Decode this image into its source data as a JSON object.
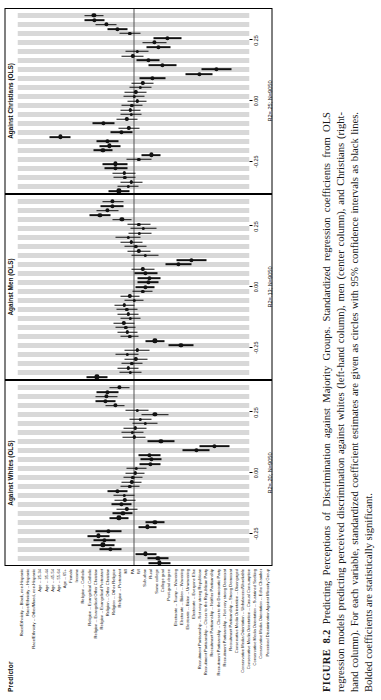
{
  "caption": {
    "figure_number": "FIGURE 8.2",
    "title": "Predicting Perceptions of Discrimination against Majority Groups.",
    "body": "Standardized regression coefficients from OLS regression models predicting perceived discrimination against whites (left-hand column), men (center column), and Christians (right-hand column). For each variable, standardized coefficient estimates are given as circles with 95% confidence intervals as black lines. Bolded coefficients are statistically significant."
  },
  "predictor_header": "Predictor",
  "chart_data": {
    "type": "scatter",
    "title": "Predicting Perceptions of Discrimination against Majority Groups",
    "xlabel": "Standardized coefficient",
    "ylabel": "Predictor",
    "xlim": [
      -0.38,
      0.38
    ],
    "xticks": [
      -0.25,
      0.0,
      0.25
    ],
    "xticklabels": [
      "-0.25",
      "0.00",
      "0.25"
    ],
    "grid": "alternating vertical gray bands per predictor",
    "legend": "none",
    "categories": [
      "Race/Ethnicity -- Black, non-Hispanic",
      "Race/Ethnicity -- Hispanic",
      "Race/Ethnicity -- Other/Mixed, non-Hispanic",
      "Age -- 25-34",
      "Age -- 35-44",
      "Age -- 45-54",
      "Age -- 55-64",
      "Age -- 65+",
      "Female",
      "Income",
      "Religion -- Catholic",
      "Religion -- Evangelical Catholic",
      "Religion -- Evangelical Other Christian",
      "Religion -- Evangelical Protestant",
      "Religion -- Other Christian",
      "Religion -- Other Religion",
      "Religion -- Protestant",
      "MI",
      "PA",
      "WI",
      "Suburban",
      "Rural",
      "Some college",
      "College grad",
      "Post-grad degree",
      "Electorate -- Trump -- Wavering",
      "Electorate -- Biden -- Wavering",
      "Electorate -- Biden -- Unwavering",
      "Electorate -- Everyone Else",
      "Recruitment Partisanship -- Not very strong Republican",
      "Recruitment Partisanship -- Closer to the Republican Party",
      "Recruitment Partisanship -- Neither Partisanship",
      "Recruitment Partisanship -- Closer to the Democratic Party",
      "Recruitment Partisanship -- Not very strong Democrat",
      "Recruitment Partisanship -- Strong Democrat",
      "Conservative Media Orientation -- Disengaged",
      "Conservative Media Orientation -- Unbalanced/Unreliable",
      "Conservative Media Orientation -- Casual Consumption",
      "Conservative Media Orientation -- Sustained Seeking",
      "Conservative Media Orientation -- Echo Chamber",
      "Perceived Discrimination Against Minority Group"
    ],
    "panels": [
      {
        "name": "whites",
        "title": "Against Whites (OLS)",
        "r2_label": "R2=.20; N=9050",
        "r2": 0.2,
        "n": 9050,
        "estimates": [
          {
            "est": -0.085,
            "lo": -0.12,
            "hi": -0.05,
            "sig": true
          },
          {
            "est": -0.08,
            "lo": -0.115,
            "hi": -0.045,
            "sig": true
          },
          {
            "est": -0.04,
            "lo": -0.075,
            "hi": -0.005,
            "sig": true
          },
          {
            "est": 0.075,
            "lo": 0.04,
            "hi": 0.11,
            "sig": true
          },
          {
            "est": 0.1,
            "lo": 0.062,
            "hi": 0.138,
            "sig": true
          },
          {
            "est": 0.095,
            "lo": 0.058,
            "hi": 0.132,
            "sig": true
          },
          {
            "est": 0.115,
            "lo": 0.078,
            "hi": 0.152,
            "sig": true
          },
          {
            "est": 0.082,
            "lo": 0.04,
            "hi": 0.124,
            "sig": true
          },
          {
            "est": -0.045,
            "lo": -0.075,
            "hi": -0.015,
            "sig": true
          },
          {
            "est": -0.07,
            "lo": -0.102,
            "hi": -0.038,
            "sig": true
          },
          {
            "est": 0.048,
            "lo": 0.018,
            "hi": 0.078,
            "sig": true
          },
          {
            "est": 0.035,
            "lo": 0.002,
            "hi": 0.068,
            "sig": true
          },
          {
            "est": 0.022,
            "lo": -0.012,
            "hi": 0.056,
            "sig": false
          },
          {
            "est": 0.04,
            "lo": 0.008,
            "hi": 0.072,
            "sig": true
          },
          {
            "est": 0.028,
            "lo": -0.006,
            "hi": 0.062,
            "sig": false
          },
          {
            "est": 0.03,
            "lo": -0.004,
            "hi": 0.064,
            "sig": false
          },
          {
            "est": 0.052,
            "lo": 0.02,
            "hi": 0.084,
            "sig": true
          },
          {
            "est": 0.012,
            "lo": -0.02,
            "hi": 0.044,
            "sig": false
          },
          {
            "est": 0.006,
            "lo": -0.026,
            "hi": 0.038,
            "sig": false
          },
          {
            "est": 0.002,
            "lo": -0.03,
            "hi": 0.034,
            "sig": false
          },
          {
            "est": -0.005,
            "lo": -0.035,
            "hi": 0.025,
            "sig": false
          },
          {
            "est": -0.01,
            "lo": -0.042,
            "hi": 0.022,
            "sig": false
          },
          {
            "est": -0.055,
            "lo": -0.09,
            "hi": -0.02,
            "sig": true
          },
          {
            "est": -0.058,
            "lo": -0.092,
            "hi": -0.024,
            "sig": true
          },
          {
            "est": -0.052,
            "lo": -0.088,
            "hi": -0.016,
            "sig": true
          },
          {
            "est": -0.205,
            "lo": -0.25,
            "hi": -0.16,
            "sig": true
          },
          {
            "est": -0.265,
            "lo": -0.315,
            "hi": -0.215,
            "sig": true
          },
          {
            "est": -0.09,
            "lo": -0.135,
            "hi": -0.045,
            "sig": true
          },
          {
            "est": -0.002,
            "lo": -0.04,
            "hi": 0.036,
            "sig": false
          },
          {
            "est": 0.004,
            "lo": -0.032,
            "hi": 0.04,
            "sig": false
          },
          {
            "est": -0.005,
            "lo": -0.042,
            "hi": 0.032,
            "sig": false
          },
          {
            "est": -0.038,
            "lo": -0.08,
            "hi": 0.004,
            "sig": false
          },
          {
            "est": -0.022,
            "lo": -0.058,
            "hi": 0.014,
            "sig": false
          },
          {
            "est": -0.07,
            "lo": -0.115,
            "hi": -0.025,
            "sig": true
          },
          {
            "est": -0.012,
            "lo": -0.05,
            "hi": 0.026,
            "sig": false
          },
          {
            "est": 0.06,
            "lo": 0.028,
            "hi": 0.092,
            "sig": true
          },
          {
            "est": 0.092,
            "lo": 0.058,
            "hi": 0.126,
            "sig": true
          },
          {
            "est": 0.088,
            "lo": 0.052,
            "hi": 0.124,
            "sig": true
          },
          {
            "est": 0.085,
            "lo": 0.048,
            "hi": 0.122,
            "sig": true
          },
          {
            "est": 0.045,
            "lo": 0.012,
            "hi": 0.078,
            "sig": true
          }
        ]
      },
      {
        "name": "men",
        "title": "Against Men (OLS)",
        "r2_label": "R2=.13; N=9050",
        "r2": 0.13,
        "n": 9050,
        "estimates": [
          {
            "est": 0.12,
            "lo": 0.085,
            "hi": 0.155,
            "sig": true
          },
          {
            "est": 0.01,
            "lo": -0.025,
            "hi": 0.045,
            "sig": false
          },
          {
            "est": 0.018,
            "lo": -0.018,
            "hi": 0.054,
            "sig": false
          },
          {
            "est": 0.005,
            "lo": -0.03,
            "hi": 0.04,
            "sig": false
          },
          {
            "est": -0.008,
            "lo": -0.045,
            "hi": 0.029,
            "sig": false
          },
          {
            "est": 0.02,
            "lo": -0.018,
            "hi": 0.058,
            "sig": false
          },
          {
            "est": -0.012,
            "lo": -0.052,
            "hi": 0.028,
            "sig": false
          },
          {
            "est": -0.155,
            "lo": -0.195,
            "hi": -0.115,
            "sig": true
          },
          {
            "est": -0.07,
            "lo": -0.102,
            "hi": -0.038,
            "sig": true
          },
          {
            "est": 0.012,
            "lo": -0.018,
            "hi": 0.042,
            "sig": false
          },
          {
            "est": 0.02,
            "lo": -0.012,
            "hi": 0.052,
            "sig": false
          },
          {
            "est": 0.025,
            "lo": -0.008,
            "hi": 0.058,
            "sig": false
          },
          {
            "est": 0.032,
            "lo": -0.002,
            "hi": 0.066,
            "sig": false
          },
          {
            "est": 0.01,
            "lo": -0.024,
            "hi": 0.044,
            "sig": false
          },
          {
            "est": 0.018,
            "lo": -0.016,
            "hi": 0.052,
            "sig": false
          },
          {
            "est": 0.022,
            "lo": -0.012,
            "hi": 0.056,
            "sig": false
          },
          {
            "est": 0.03,
            "lo": -0.002,
            "hi": 0.062,
            "sig": false
          },
          {
            "est": -0.002,
            "lo": -0.034,
            "hi": 0.03,
            "sig": false
          },
          {
            "est": 0.012,
            "lo": -0.02,
            "hi": 0.044,
            "sig": false
          },
          {
            "est": -0.03,
            "lo": -0.062,
            "hi": 0.002,
            "sig": false
          },
          {
            "est": -0.038,
            "lo": -0.07,
            "hi": -0.006,
            "sig": true
          },
          {
            "est": -0.048,
            "lo": -0.082,
            "hi": -0.014,
            "sig": true
          },
          {
            "est": -0.052,
            "lo": -0.09,
            "hi": -0.014,
            "sig": true
          },
          {
            "est": -0.04,
            "lo": -0.078,
            "hi": -0.002,
            "sig": true
          },
          {
            "est": -0.03,
            "lo": -0.068,
            "hi": 0.008,
            "sig": false
          },
          {
            "est": -0.148,
            "lo": -0.19,
            "hi": -0.106,
            "sig": true
          },
          {
            "est": -0.19,
            "lo": -0.238,
            "hi": -0.142,
            "sig": true
          },
          {
            "est": -0.038,
            "lo": -0.082,
            "hi": 0.006,
            "sig": false
          },
          {
            "est": -0.018,
            "lo": -0.056,
            "hi": 0.02,
            "sig": false
          },
          {
            "est": -0.008,
            "lo": -0.044,
            "hi": 0.028,
            "sig": false
          },
          {
            "est": 0.008,
            "lo": -0.028,
            "hi": 0.044,
            "sig": false
          },
          {
            "est": 0.018,
            "lo": -0.022,
            "hi": 0.058,
            "sig": false
          },
          {
            "est": -0.02,
            "lo": -0.058,
            "hi": 0.018,
            "sig": false
          },
          {
            "est": -0.032,
            "lo": -0.075,
            "hi": 0.011,
            "sig": false
          },
          {
            "est": -0.018,
            "lo": -0.056,
            "hi": 0.02,
            "sig": false
          },
          {
            "est": 0.038,
            "lo": 0.006,
            "hi": 0.07,
            "sig": true
          },
          {
            "est": 0.11,
            "lo": 0.076,
            "hi": 0.144,
            "sig": true
          },
          {
            "est": 0.085,
            "lo": 0.05,
            "hi": 0.12,
            "sig": true
          },
          {
            "est": 0.07,
            "lo": 0.032,
            "hi": 0.108,
            "sig": true
          },
          {
            "est": 0.068,
            "lo": 0.034,
            "hi": 0.102,
            "sig": true
          }
        ]
      },
      {
        "name": "christians",
        "title": "Against Christians (OLS)",
        "r2_label": "R2=.25; N=9050",
        "r2": 0.25,
        "n": 9050,
        "estimates": [
          {
            "est": 0.048,
            "lo": 0.014,
            "hi": 0.082,
            "sig": true
          },
          {
            "est": 0.018,
            "lo": -0.016,
            "hi": 0.052,
            "sig": false
          },
          {
            "est": 0.008,
            "lo": -0.028,
            "hi": 0.044,
            "sig": false
          },
          {
            "est": 0.028,
            "lo": -0.008,
            "hi": 0.064,
            "sig": false
          },
          {
            "est": 0.03,
            "lo": -0.008,
            "hi": 0.068,
            "sig": false
          },
          {
            "est": 0.058,
            "lo": 0.02,
            "hi": 0.096,
            "sig": true
          },
          {
            "est": 0.06,
            "lo": 0.02,
            "hi": 0.1,
            "sig": true
          },
          {
            "est": -0.018,
            "lo": -0.058,
            "hi": 0.022,
            "sig": false
          },
          {
            "est": -0.058,
            "lo": -0.09,
            "hi": -0.026,
            "sig": true
          },
          {
            "est": 0.1,
            "lo": 0.068,
            "hi": 0.132,
            "sig": true
          },
          {
            "est": 0.078,
            "lo": 0.044,
            "hi": 0.112,
            "sig": true
          },
          {
            "est": 0.085,
            "lo": 0.05,
            "hi": 0.12,
            "sig": true
          },
          {
            "est": 0.24,
            "lo": 0.205,
            "hi": 0.275,
            "sig": true
          },
          {
            "est": 0.04,
            "lo": 0.004,
            "hi": 0.076,
            "sig": true
          },
          {
            "est": 0.015,
            "lo": -0.02,
            "hi": 0.05,
            "sig": false
          },
          {
            "est": 0.098,
            "lo": 0.062,
            "hi": 0.134,
            "sig": true
          },
          {
            "est": 0.022,
            "lo": -0.012,
            "hi": 0.056,
            "sig": false
          },
          {
            "est": 0.008,
            "lo": -0.026,
            "hi": 0.042,
            "sig": false
          },
          {
            "est": 0.01,
            "lo": -0.024,
            "hi": 0.044,
            "sig": false
          },
          {
            "est": 0.006,
            "lo": -0.028,
            "hi": 0.04,
            "sig": false
          },
          {
            "est": -0.012,
            "lo": -0.044,
            "hi": 0.02,
            "sig": false
          },
          {
            "est": -0.002,
            "lo": -0.036,
            "hi": 0.032,
            "sig": false
          },
          {
            "est": -0.008,
            "lo": -0.044,
            "hi": 0.028,
            "sig": false
          },
          {
            "est": -0.022,
            "lo": -0.058,
            "hi": 0.014,
            "sig": false
          },
          {
            "est": -0.03,
            "lo": -0.066,
            "hi": 0.006,
            "sig": false
          },
          {
            "est": -0.062,
            "lo": -0.104,
            "hi": -0.02,
            "sig": true
          },
          {
            "est": -0.215,
            "lo": -0.26,
            "hi": -0.17,
            "sig": true
          },
          {
            "est": -0.272,
            "lo": -0.322,
            "hi": -0.222,
            "sig": true
          },
          {
            "est": -0.095,
            "lo": -0.14,
            "hi": -0.05,
            "sig": true
          },
          {
            "est": -0.048,
            "lo": -0.086,
            "hi": -0.01,
            "sig": true
          },
          {
            "est": 0.002,
            "lo": -0.034,
            "hi": 0.038,
            "sig": false
          },
          {
            "est": -0.012,
            "lo": -0.05,
            "hi": 0.026,
            "sig": false
          },
          {
            "est": -0.082,
            "lo": -0.122,
            "hi": -0.042,
            "sig": true
          },
          {
            "est": -0.068,
            "lo": -0.108,
            "hi": -0.028,
            "sig": true
          },
          {
            "est": -0.112,
            "lo": -0.158,
            "hi": -0.066,
            "sig": true
          },
          {
            "est": 0.012,
            "lo": -0.022,
            "hi": 0.046,
            "sig": false
          },
          {
            "est": 0.052,
            "lo": 0.018,
            "hi": 0.086,
            "sig": true
          },
          {
            "est": 0.09,
            "lo": 0.056,
            "hi": 0.124,
            "sig": true
          },
          {
            "est": 0.128,
            "lo": 0.094,
            "hi": 0.162,
            "sig": true
          },
          {
            "est": 0.13,
            "lo": 0.098,
            "hi": 0.162,
            "sig": true
          }
        ]
      }
    ]
  }
}
